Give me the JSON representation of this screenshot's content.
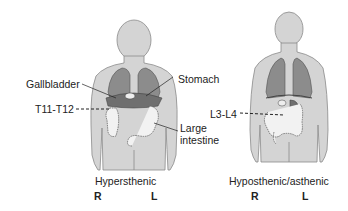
{
  "figures": [
    {
      "caption": "Hypersthenic",
      "right_label": "R",
      "left_label": "L",
      "labels": {
        "gallbladder": "Gallbladder",
        "level": "T11-T12",
        "stomach": "Stomach",
        "large_intestine_1": "Large",
        "large_intestine_2": "intestine"
      }
    },
    {
      "caption": "Hyposthenic/asthenic",
      "right_label": "R",
      "left_label": "L",
      "labels": {
        "level": "L3-L4"
      }
    }
  ],
  "colors": {
    "body": "#d4d4d4",
    "body_outline": "#8a8a8a",
    "lungs": "#8c8c8c",
    "organs": "#6f6f6f",
    "intestine": "#f2f2f2"
  }
}
